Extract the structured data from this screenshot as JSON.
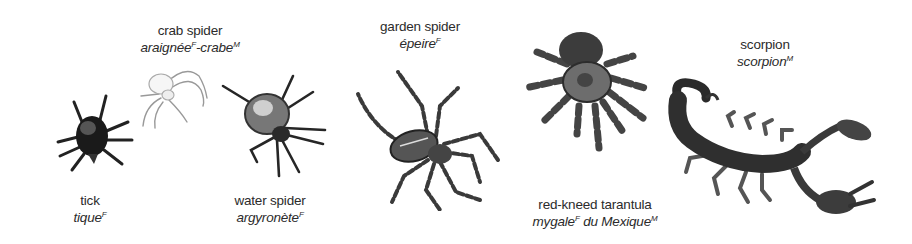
{
  "items": [
    {
      "id": "tick",
      "english": "tick",
      "french": [
        {
          "word": "tique",
          "gender": "F"
        }
      ]
    },
    {
      "id": "crab-spider",
      "english": "crab spider",
      "french": [
        {
          "word": "araignée",
          "gender": "F"
        },
        {
          "word": "-crabe",
          "gender": "M"
        }
      ]
    },
    {
      "id": "water-spider",
      "english": "water spider",
      "french": [
        {
          "word": "argyronète",
          "gender": "F"
        }
      ]
    },
    {
      "id": "garden-spider",
      "english": "garden spider",
      "french": [
        {
          "word": "épeire",
          "gender": "F"
        }
      ]
    },
    {
      "id": "red-kneed-tarantula",
      "english": "red-kneed tarantula",
      "french": [
        {
          "word": "mygale",
          "gender": "F"
        },
        {
          "word": " du Mexique",
          "gender": "M"
        }
      ]
    },
    {
      "id": "scorpion",
      "english": "scorpion",
      "french": [
        {
          "word": "scorpion",
          "gender": "M"
        }
      ]
    }
  ]
}
